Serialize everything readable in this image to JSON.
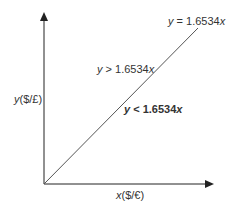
{
  "diagram": {
    "line_label": {
      "var_y": "y",
      "rest": " = 1.6534",
      "var_x": "x"
    },
    "region_above": {
      "var_y": "y",
      "rest": " > 1.6534",
      "var_x": "x"
    },
    "region_below": {
      "var_y": "y",
      "rest": " < 1.6534",
      "var_x": "x"
    },
    "y_axis_label": {
      "var": "y",
      "unit": "($/£)"
    },
    "x_axis_label": {
      "var": "x",
      "unit": "($/€)"
    },
    "colors": {
      "axis": "#222222",
      "line": "#555555",
      "text": "#333333"
    }
  }
}
